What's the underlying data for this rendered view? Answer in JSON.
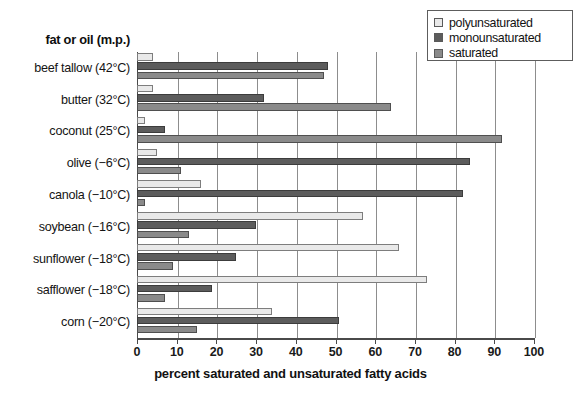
{
  "axis_header_label": "fat or oil (m.p.)",
  "legend": {
    "items": [
      {
        "label": "polyunsaturated",
        "color": "#e9e9e9",
        "key": "polyunsaturated"
      },
      {
        "label": "monounsaturated",
        "color": "#5c5c5c",
        "key": "monounsaturated"
      },
      {
        "label": "saturated",
        "color": "#8a8a8a",
        "key": "saturated"
      }
    ]
  },
  "chart_data": {
    "type": "bar",
    "orientation": "horizontal",
    "title": "",
    "xlabel": "percent saturated and unsaturated fatty acids",
    "ylabel": "fat or oil (m.p.)",
    "xlim": [
      0,
      100
    ],
    "xticks": [
      0,
      10,
      20,
      30,
      40,
      50,
      60,
      70,
      80,
      90,
      100
    ],
    "xticklabels": [
      "0",
      "10",
      "20",
      "30",
      "40",
      "50",
      "60",
      "70",
      "80",
      "90",
      "100"
    ],
    "grid": "vertical",
    "legend_position": "top-right",
    "categories": [
      "beef tallow (42°C)",
      "butter (32°C)",
      "coconut (25°C)",
      "olive (−6°C)",
      "canola (−10°C)",
      "soybean (−16°C)",
      "sunflower (−18°C)",
      "safflower (−18°C)",
      "corn (−20°C)"
    ],
    "series": [
      {
        "name": "polyunsaturated",
        "color": "#e9e9e9",
        "values": [
          4,
          4,
          2,
          5,
          16,
          57,
          66,
          73,
          34
        ]
      },
      {
        "name": "monounsaturated",
        "color": "#5c5c5c",
        "values": [
          48,
          32,
          7,
          84,
          82,
          30,
          25,
          19,
          51
        ]
      },
      {
        "name": "saturated",
        "color": "#8a8a8a",
        "values": [
          47,
          64,
          92,
          11,
          2,
          13,
          9,
          7,
          15
        ]
      }
    ]
  }
}
